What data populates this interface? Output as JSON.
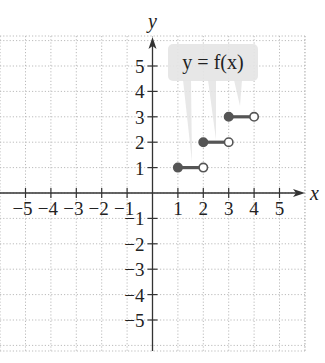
{
  "chart_data": {
    "type": "line",
    "title": "",
    "xlabel": "x",
    "ylabel": "y",
    "xlim": [
      -6,
      6
    ],
    "ylim": [
      -6,
      6
    ],
    "grid": true,
    "x_ticks": [
      -5,
      -4,
      -3,
      -2,
      -1,
      1,
      2,
      3,
      4,
      5
    ],
    "x_tick_labels": [
      "−5",
      "−4",
      "−3",
      "−2",
      "−1",
      "1",
      "2",
      "3",
      "4",
      "5"
    ],
    "y_ticks": [
      5,
      4,
      3,
      2,
      1,
      -1,
      -2,
      -3,
      -4,
      -5
    ],
    "y_tick_labels": [
      "5",
      "4",
      "3",
      "2",
      "1",
      "−1",
      "−2",
      "−3",
      "−4",
      "−5"
    ],
    "annotation": "y = f(x)",
    "series": [
      {
        "name": "f(x)",
        "style": "step",
        "segments": [
          {
            "x_start": 1,
            "x_end": 2,
            "y": 1,
            "start": "closed",
            "end": "open"
          },
          {
            "x_start": 2,
            "x_end": 3,
            "y": 2,
            "start": "closed",
            "end": "open"
          },
          {
            "x_start": 3,
            "x_end": 4,
            "y": 3,
            "start": "closed",
            "end": "open"
          }
        ]
      }
    ],
    "colors": {
      "segment": "#555555",
      "axis": "#333333",
      "grid": "#bbbbbb",
      "label_box": "#e4e4e4"
    }
  }
}
